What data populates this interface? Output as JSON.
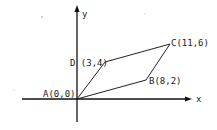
{
  "diagram": {
    "type": "coordinate-geometry",
    "shape": "parallelogram",
    "axes": {
      "x_label": "x",
      "y_label": "y"
    },
    "vertices": [
      {
        "name": "A",
        "label": "A(0,0)",
        "x": 0,
        "y": 0
      },
      {
        "name": "B",
        "label": "B(8,2)",
        "x": 8,
        "y": 2
      },
      {
        "name": "C",
        "label": "C(11,6)",
        "x": 11,
        "y": 6
      },
      {
        "name": "D",
        "label": "D (3,4)",
        "x": 3,
        "y": 4
      }
    ],
    "edges": [
      [
        "A",
        "B"
      ],
      [
        "B",
        "C"
      ],
      [
        "C",
        "D"
      ],
      [
        "D",
        "A"
      ]
    ],
    "colors": {
      "ink": "#111111",
      "background": "#ffffff"
    }
  }
}
